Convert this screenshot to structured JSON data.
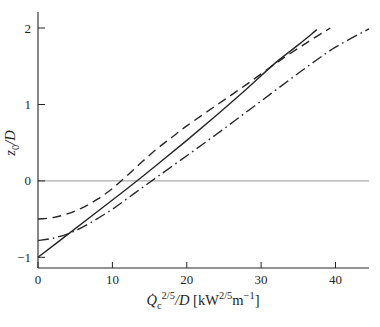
{
  "figure": {
    "background": "#ffffff",
    "ink_color": "#262626",
    "reference_line_color": "#6b6b6b"
  },
  "chart_data": {
    "type": "line",
    "title": "",
    "xlabel_plain": "Qc^{2/5}/D [kW^{2/5} m^{-1}]",
    "ylabel_plain": "z0/D",
    "xlabel_tokens": [
      {
        "t": "Q̇",
        "s": "i"
      },
      {
        "t": "c",
        "s": "sub"
      },
      {
        "t": "2/5",
        "s": "sup"
      },
      {
        "t": "/D",
        "s": "i"
      },
      {
        "t": " [kW",
        "s": "n"
      },
      {
        "t": "2/5",
        "s": "sup"
      },
      {
        "t": "m",
        "s": "n"
      },
      {
        "t": "−1",
        "s": "sup"
      },
      {
        "t": "]",
        "s": "n"
      }
    ],
    "ylabel_tokens": [
      {
        "t": "z",
        "s": "i"
      },
      {
        "t": "0",
        "s": "sub"
      },
      {
        "t": "/D",
        "s": "i"
      }
    ],
    "xlim": [
      0,
      44.5
    ],
    "ylim": [
      -1.14,
      2.21
    ],
    "x_ticks": {
      "values": [
        0,
        10,
        20,
        30,
        40
      ],
      "labels": [
        "0",
        "10",
        "20",
        "30",
        "40"
      ]
    },
    "y_ticks": {
      "values": [
        -1,
        0,
        1,
        2
      ],
      "labels": [
        "−1",
        "0",
        "1",
        "2"
      ]
    },
    "reference_line_y": 0,
    "grid": false,
    "legend": "none",
    "series": [
      {
        "name": "solid-line",
        "line_style": "solid",
        "points": [
          [
            0,
            -1.0
          ],
          [
            4,
            -0.7
          ],
          [
            8,
            -0.4
          ],
          [
            12,
            -0.1
          ],
          [
            16,
            0.21
          ],
          [
            20,
            0.53
          ],
          [
            24,
            0.86
          ],
          [
            28,
            1.2
          ],
          [
            32,
            1.55
          ],
          [
            35,
            1.78
          ],
          [
            37.5,
            1.98
          ]
        ]
      },
      {
        "name": "dashed-line",
        "line_style": "dashed",
        "points": [
          [
            0,
            -0.5
          ],
          [
            2,
            -0.48
          ],
          [
            4,
            -0.43
          ],
          [
            6,
            -0.35
          ],
          [
            8,
            -0.24
          ],
          [
            10,
            -0.1
          ],
          [
            12,
            0.07
          ],
          [
            14,
            0.25
          ],
          [
            16,
            0.42
          ],
          [
            18,
            0.57
          ],
          [
            20,
            0.72
          ],
          [
            24,
            0.99
          ],
          [
            28,
            1.26
          ],
          [
            32,
            1.54
          ],
          [
            36,
            1.8
          ],
          [
            39.3,
            2.0
          ]
        ]
      },
      {
        "name": "dash-dot-line",
        "line_style": "dashdot",
        "points": [
          [
            0,
            -0.78
          ],
          [
            2,
            -0.75
          ],
          [
            4.4,
            -0.68
          ],
          [
            7,
            -0.55
          ],
          [
            10,
            -0.37
          ],
          [
            13,
            -0.16
          ],
          [
            16,
            0.05
          ],
          [
            20,
            0.33
          ],
          [
            24,
            0.61
          ],
          [
            28,
            0.9
          ],
          [
            32,
            1.19
          ],
          [
            36,
            1.48
          ],
          [
            40,
            1.75
          ],
          [
            44.5,
            1.99
          ]
        ]
      }
    ]
  }
}
